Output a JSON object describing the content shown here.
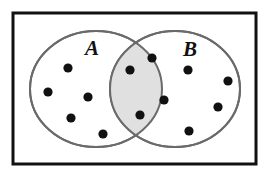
{
  "figure": {
    "name": "venn-diagram-two-sets",
    "canvas": {
      "width": 269,
      "height": 172,
      "background": "#ffffff"
    }
  },
  "frame": {
    "name": "outer-frame",
    "x": 13,
    "y": 13,
    "width": 243,
    "height": 151,
    "stroke": "#111111",
    "stroke_width": 3,
    "fill": "#ffffff"
  },
  "sets": {
    "a": {
      "label": "A",
      "label_x": 92,
      "label_y": 55,
      "cx": 96,
      "cy": 89,
      "rx": 66,
      "ry": 58,
      "stroke": "#6a6a6a",
      "stroke_width": 2,
      "fill": "#ffffff"
    },
    "b": {
      "label": "B",
      "label_x": 190,
      "label_y": 56,
      "cx": 175,
      "cy": 89,
      "rx": 65,
      "ry": 58,
      "stroke": "#6a6a6a",
      "stroke_width": 2,
      "fill": "#ffffff"
    }
  },
  "intersection": {
    "name": "a-intersect-b",
    "fill": "#e0e0e0",
    "stroke": "#6a6a6a",
    "stroke_width": 2,
    "left_x": 110,
    "right_x": 162
  },
  "dot_style": {
    "radius": 4.6,
    "fill": "#111111"
  },
  "dots": {
    "a_only": [
      {
        "cx": 68,
        "cy": 68
      },
      {
        "cx": 48,
        "cy": 92
      },
      {
        "cx": 88,
        "cy": 97
      },
      {
        "cx": 71,
        "cy": 118
      },
      {
        "cx": 103,
        "cy": 134
      }
    ],
    "intersection": [
      {
        "cx": 152,
        "cy": 58
      },
      {
        "cx": 130,
        "cy": 70
      },
      {
        "cx": 164,
        "cy": 100
      },
      {
        "cx": 140,
        "cy": 115
      }
    ],
    "b_only": [
      {
        "cx": 188,
        "cy": 70
      },
      {
        "cx": 228,
        "cy": 81
      },
      {
        "cx": 218,
        "cy": 107
      },
      {
        "cx": 189,
        "cy": 131
      }
    ]
  },
  "counts": {
    "a_only": 5,
    "intersection": 4,
    "b_only": 4,
    "total": 13
  }
}
